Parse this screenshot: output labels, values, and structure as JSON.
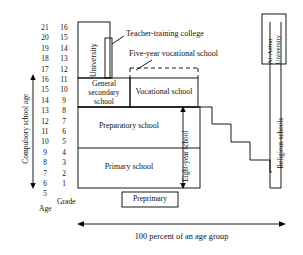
{
  "diagram": {
    "axis_caption": "100 percent of an age group",
    "left_axis": {
      "compulsory_label": "Compulsory school age",
      "age_header": "Age",
      "grade_header": "Grade",
      "ages": [
        "21",
        "20",
        "19",
        "18",
        "17",
        "16",
        "15",
        "14",
        "13",
        "12",
        "11",
        "10",
        "9",
        "8",
        "7",
        "6",
        "5"
      ],
      "grades": [
        "16",
        "15",
        "14",
        "13",
        "12",
        "11",
        "10",
        "9",
        "8",
        "7",
        "6",
        "5",
        "4",
        "3",
        "2",
        "1"
      ]
    },
    "boxes": {
      "university": "University",
      "teacher_training": "Teacher-training college",
      "five_year_vocational": "Five-year vocational school",
      "general_secondary": "General secondary school",
      "general_secondary_l1": "General",
      "general_secondary_l2": "secondary",
      "general_secondary_l3": "school",
      "vocational": "Vocational school",
      "preparatory": "Preparatory school",
      "primary": "Primary school",
      "preprimary": "Preprimary",
      "eight_year": "Eight-year school",
      "religious": "Religious schools",
      "al_azhar_l1": "Al-Azhar",
      "al_azhar_l2": "University"
    },
    "colors": {
      "line": "#000000",
      "background": "#ffffff",
      "text": "#111111"
    }
  }
}
